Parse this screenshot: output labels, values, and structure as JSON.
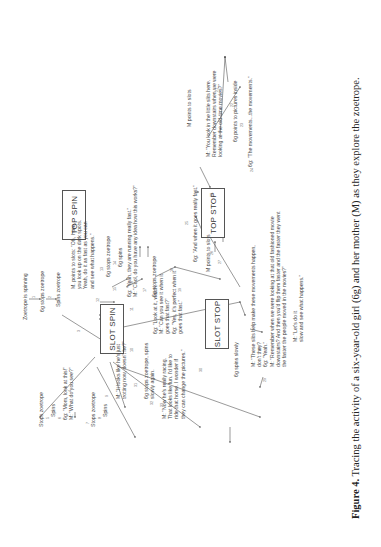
{
  "figure": {
    "caption_label": "Figure 4.",
    "caption_text": " Tracing the activity of a six-year-old girl (6g) and her mother (M) as they explore the zoetrope."
  },
  "boxes": {
    "slot_spin": "SLOT SPIN",
    "top_spin": "TOP SPIN",
    "top_stop": "TOP STOP",
    "slot_stop": "SLOT STOP"
  },
  "nodes": {
    "zoetrope_spinning": "Zoetrope is spinning",
    "stops_zoetrope_1": "6g stops zoetrope",
    "spins_zoetrope_1": "Spins zoetrope",
    "m_points_slots_1": "M. points to slots: \"Oh, I see,\nyou look up on the dark spots.\nYeah, do it as fast as you can\nand see what happens.\"",
    "stops_zoetrope_13": "6g stops zoetrope",
    "spins_14": "6g spins",
    "running_fast": "6g: \"Yeah, they are running really fast.\"\nM: \"Cool, do you have any idea how this works?\"",
    "stops_zoetrope_18": "6g stops zoetrope",
    "look_watch": "6g: \"Look at it, watch.\nM: \"Can you see it when it\ngoes that fast?\"\n6g: \"Yes, it's perfect when it\ngoes that fast.\"",
    "stops_zoetrope_left": "Stops zoetrope",
    "spins_left": "Spins",
    "mom_look": "6g: \"Mom, look at this!\"\nM: \"What do you see?\"",
    "stops_zoetrope_mid": "Stops zoetrope",
    "spins_mid": "Spins",
    "trotting": "M: \"It looks like he's just\ntrotting now, doesn't he?\"",
    "stops_spins_slowly": "6g stops zoetrope, spins\nslowly again.",
    "racing": "M: \"Now he's really racing.\nThat looks like fun. I'd like to\nride that horse. I wonder if\nthey can change the pictures.\"",
    "spins_slowly": "6g spins slowly",
    "lets_do_it": "M: \"Let's do it\nslow and see what happens.\"",
    "really_fast": "6g: \"And when it goes really fast.\"",
    "m_points_slots_26": "M points to slots",
    "slits_help": "M: \"These slits help make these movements happen,\ndon't they?\n6g: \"Yeah.\"\nM: \"Remember when we were looking at that old fashioned movie\ndownstairs? And then you'd flip them faster and the faster they went\nthe faster the people moved in the movies?\"",
    "m_points_slots_top": "M points to slots",
    "little_slits": "M: \"You look in the little slits here.\nRemember downstairs when we were\nlooking at the old-time movies?\"",
    "points_pictures": "6g points to pictures inside",
    "the_movements": "6g: \"The movements...the movements.\""
  },
  "arrow_numbers": [
    "1",
    "2",
    "3",
    "4",
    "5",
    "6",
    "7",
    "8",
    "9",
    "10",
    "11",
    "12",
    "13",
    "14",
    "15",
    "16",
    "17",
    "18",
    "19",
    "20",
    "21",
    "22",
    "23",
    "24",
    "25",
    "26",
    "27",
    "28",
    "29",
    "30",
    "31",
    "32",
    "33"
  ]
}
